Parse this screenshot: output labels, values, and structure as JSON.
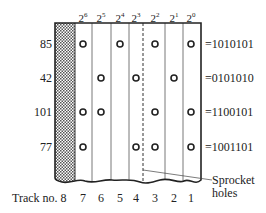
{
  "diagram": {
    "type": "punched paper tape encoding",
    "bit_weights": [
      {
        "base": "2",
        "exp": "6"
      },
      {
        "base": "2",
        "exp": "5"
      },
      {
        "base": "2",
        "exp": "4"
      },
      {
        "base": "2",
        "exp": "3"
      },
      {
        "base": "2",
        "exp": "2"
      },
      {
        "base": "2",
        "exp": "1"
      },
      {
        "base": "2",
        "exp": "0"
      }
    ],
    "rows": [
      {
        "decimal": "85",
        "binary": "=1010101",
        "bits": [
          1,
          0,
          1,
          0,
          1,
          0,
          1
        ]
      },
      {
        "decimal": "42",
        "binary": "=0101010",
        "bits": [
          0,
          1,
          0,
          1,
          0,
          1,
          0
        ]
      },
      {
        "decimal": "101",
        "binary": "=1100101",
        "bits": [
          1,
          1,
          0,
          0,
          1,
          0,
          1
        ]
      },
      {
        "decimal": "77",
        "binary": "=1001101",
        "bits": [
          1,
          0,
          0,
          1,
          1,
          0,
          1
        ]
      }
    ],
    "track_label": "Track no. 8",
    "tracks": [
      "7",
      "6",
      "5",
      "4",
      "3",
      "2",
      "1"
    ],
    "sprocket_label_line1": "Sprocket",
    "sprocket_label_line2": "holes",
    "colors": {
      "ink": "#222222",
      "paper": "#ffffff",
      "hatch": "#555555"
    }
  }
}
